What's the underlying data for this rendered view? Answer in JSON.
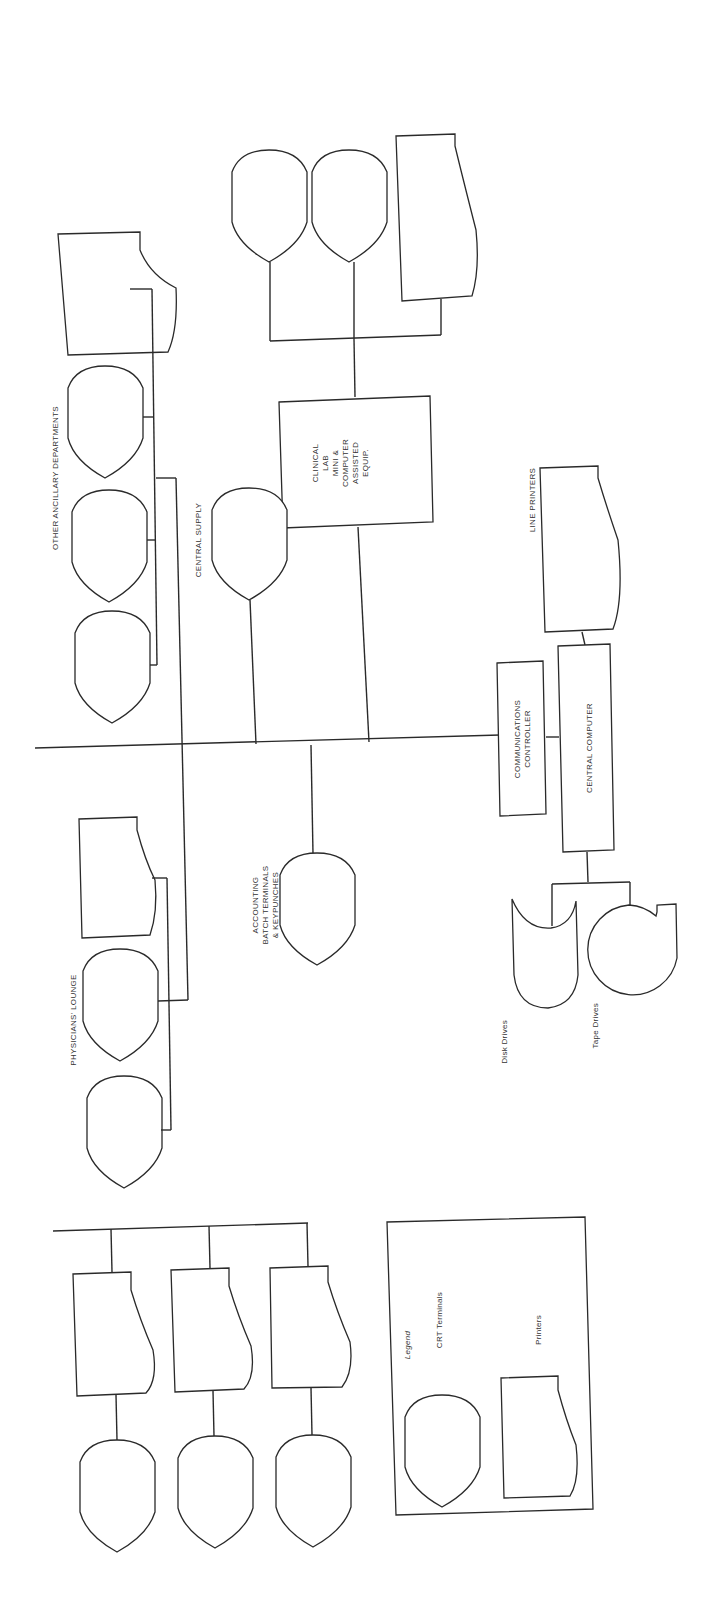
{
  "diagram": {
    "type": "hospital computer network block diagram (rotated 90 degrees)",
    "colors": {
      "line": "#2a2a2a",
      "text": "#333333",
      "background": "#ffffff"
    },
    "groups": {
      "clinical_lab": {
        "label_lines": [
          "CLINICAL",
          "LAB",
          "MINI &",
          "COMPUTER",
          "ASSISTED",
          "EQUIP."
        ],
        "devices": [
          "crt-terminal",
          "crt-terminal",
          "printer"
        ]
      },
      "other_ancillary": {
        "label": "OTHER ANCILLARY DEPARTMENTS",
        "devices": [
          "printer",
          "crt-terminal",
          "crt-terminal",
          "crt-terminal"
        ]
      },
      "central_supply": {
        "label": "CENTRAL SUPPLY",
        "devices": [
          "crt-terminal"
        ]
      },
      "line_printers": {
        "label": "LINE PRINTERS"
      },
      "communications_controller": {
        "label_lines": [
          "COMMUNICATIONS",
          "CONTROLLER"
        ]
      },
      "central_computer": {
        "label": "CENTRAL COMPUTER"
      },
      "disk_drives": {
        "label": "Disk Drives"
      },
      "tape_drives": {
        "label": "Tape Drives"
      },
      "accounting": {
        "label_lines": [
          "ACCOUNTING",
          "BATCH TERMINALS",
          "& KEYPUNCHES"
        ],
        "devices": [
          "crt-terminal"
        ]
      },
      "physicians_lounge": {
        "label": "PHYSICIANS' LOUNGE",
        "devices": [
          "printer",
          "crt-terminal",
          "crt-terminal"
        ]
      },
      "nursing_stations": {
        "devices": [
          {
            "printer": 1,
            "crt": 1
          },
          {
            "printer": 1,
            "crt": 1
          },
          {
            "printer": 1,
            "crt": 1
          }
        ]
      }
    },
    "legend": {
      "title": "Legend",
      "items": [
        {
          "label": "CRT Terminals",
          "icon": "crt-terminal-icon"
        },
        {
          "label": "Printers",
          "icon": "printer-icon"
        }
      ]
    }
  }
}
